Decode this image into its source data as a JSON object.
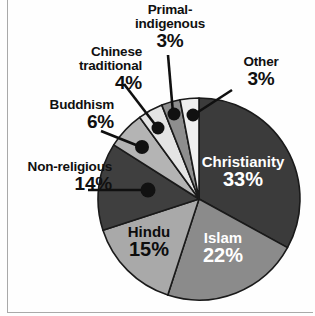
{
  "chart_data": {
    "type": "pie",
    "title": "",
    "subtitle": "",
    "xlabel": "",
    "ylabel": "",
    "legend_position": "none",
    "grid": false,
    "units": "percent",
    "total": 100,
    "start_angle_deg": 0,
    "direction": "clockwise",
    "categories": [
      "Christianity",
      "Islam",
      "Hindu",
      "Non-religious",
      "Buddhism",
      "Chinese traditional",
      "Primal-indigenous",
      "Other"
    ],
    "values": [
      33,
      22,
      15,
      14,
      6,
      4,
      3,
      3
    ],
    "slices": [
      {
        "label": "Christianity",
        "value": 33,
        "value_text": "33%",
        "color": "#3b3b3b",
        "label_placement": "inside",
        "label_color": "#ffffff"
      },
      {
        "label": "Islam",
        "value": 22,
        "value_text": "22%",
        "color": "#8b8b8b",
        "label_placement": "inside",
        "label_color": "#ffffff"
      },
      {
        "label": "Hindu",
        "value": 15,
        "value_text": "15%",
        "color": "#a9a9a9",
        "label_placement": "inside",
        "label_color": "#0d0d0d"
      },
      {
        "label": "Non-religious",
        "value": 14,
        "value_text": "14%",
        "color": "#3f3f3f",
        "label_placement": "outside",
        "label_color": "#101010"
      },
      {
        "label": "Buddhism",
        "value": 6,
        "value_text": "6%",
        "color": "#b4b4b4",
        "label_placement": "outside",
        "label_color": "#101010"
      },
      {
        "label": "Chinese traditional",
        "value": 4,
        "value_text": "4%",
        "color": "#e4e4e4",
        "label_placement": "outside",
        "label_color": "#101010"
      },
      {
        "label": "Primal-indigenous",
        "value": 3,
        "value_text": "3%",
        "color": "#8e8e8e",
        "label_placement": "outside",
        "label_color": "#101010"
      },
      {
        "label": "Other",
        "value": 3,
        "value_text": "3%",
        "color": "#efefef",
        "label_placement": "outside",
        "label_color": "#101010"
      }
    ]
  },
  "labels": {
    "primal": {
      "line1": "Primal-",
      "line2": "indigenous",
      "pct": "3%"
    },
    "chinese": {
      "line1": "Chinese",
      "line2": "traditional",
      "pct": "4%"
    },
    "buddhism": {
      "line1": "Buddhism",
      "pct": "6%"
    },
    "nonreligious": {
      "line1": "Non-religious",
      "pct": "14%"
    },
    "other": {
      "line1": "Other",
      "pct": "3%"
    },
    "christianity": {
      "line1": "Christianity",
      "pct": "33%"
    },
    "islam": {
      "line1": "Islam",
      "pct": "22%"
    },
    "hindu": {
      "line1": "Hindu",
      "pct": "15%"
    }
  },
  "style": {
    "background": "#fefefe",
    "slice_outline": "#1a1a1a",
    "leader_line": "#101010",
    "frame_rule": "#a9a9a9"
  }
}
